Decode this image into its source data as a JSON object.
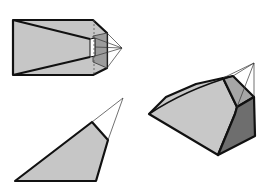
{
  "diagram": {
    "title": "",
    "colors": {
      "background": "#ffffff",
      "light_face": "#c8c8c8",
      "mid_face": "#a8a8a8",
      "dark_face": "#707070",
      "edge": "#111111"
    },
    "figures": [
      {
        "name": "front-view-prism",
        "label": ""
      },
      {
        "name": "side-view-triangle",
        "label": ""
      },
      {
        "name": "oblique-view-solid",
        "label": ""
      }
    ]
  }
}
